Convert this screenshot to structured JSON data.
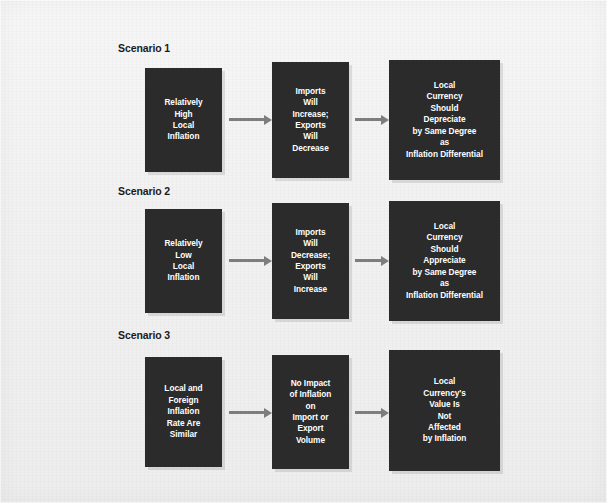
{
  "figure": {
    "background_color": "#f2f2f2",
    "node_color": "#2b2b2b",
    "node_text_color": "#ffffff",
    "arrow_color": "#7d7d7d",
    "label_color": "#1b1b1b"
  },
  "scenarios": [
    {
      "label": "Scenario 1",
      "nodes": [
        {
          "text": "Relatively\nHigh\nLocal\nInflation"
        },
        {
          "text": "Imports\nWill\nIncrease;\nExports\nWill\nDecrease"
        },
        {
          "text": "Local\nCurrency\nShould\nDepreciate\nby Same Degree\nas\nInflation Differential"
        }
      ]
    },
    {
      "label": "Scenario 2",
      "nodes": [
        {
          "text": "Relatively\nLow\nLocal\nInflation"
        },
        {
          "text": "Imports\nWill\nDecrease;\nExports\nWill\nIncrease"
        },
        {
          "text": "Local\nCurrency\nShould\nAppreciate\nby Same Degree\nas\nInflation Differential"
        }
      ]
    },
    {
      "label": "Scenario 3",
      "nodes": [
        {
          "text": "Local and\nForeign\nInflation\nRate Are\nSimilar"
        },
        {
          "text": "No Impact\nof Inflation\non\nImport or\nExport\nVolume"
        },
        {
          "text": "Local\nCurrency's\nValue Is\nNot\nAffected\nby Inflation"
        }
      ]
    }
  ]
}
